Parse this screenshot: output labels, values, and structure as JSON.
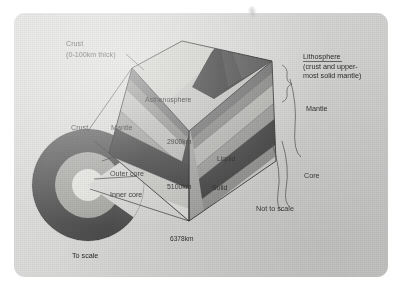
{
  "figure": {
    "type": "diagram",
    "media": "scanned photograph of a printed diagram",
    "background_color": "#d9d9d7"
  },
  "labels": {
    "crust_top": "Crust",
    "crust_top_detail": "(0-100km thick)",
    "asthenosphere": "Asthenosphere",
    "lithosphere": "Lithosphere",
    "lithosphere_detail_1": "(crust and upper-",
    "lithosphere_detail_2": "most solid mantle)",
    "mantle_right": "Mantle",
    "crust_left": "Crust",
    "mantle_left": "Mantle",
    "outer_core": "Outer core",
    "inner_core": "Inner core",
    "liquid": "Liquid",
    "solid": "Solid",
    "core_right": "Core",
    "depth_2900": "2900km",
    "depth_5100": "5100km",
    "radius_6378": "6378km",
    "not_to_scale": "Not to scale",
    "to_scale": "To scale"
  },
  "depths": {
    "crust_thickness_km": "0-100",
    "mantle_core_boundary_km": "2900",
    "outer_inner_core_boundary_km": "5100",
    "earth_radius_km": "6378"
  },
  "layers": [
    {
      "name": "Crust",
      "state": "Solid",
      "color": "#5e5e5e"
    },
    {
      "name": "Lithosphere",
      "state": "Solid",
      "color": "#6f6f6f"
    },
    {
      "name": "Asthenosphere",
      "state": "Plastic",
      "color": "#a9a9a7"
    },
    {
      "name": "Mantle",
      "state": "Solid",
      "color": "#3c3c3c"
    },
    {
      "name": "Outer core",
      "state": "Liquid",
      "color": "#8e8e8c"
    },
    {
      "name": "Inner core",
      "state": "Solid",
      "color": "#d2d2cf"
    }
  ],
  "globe": {
    "caption": "To scale",
    "rings": [
      {
        "name": "Mantle",
        "color": "#4a4a4a"
      },
      {
        "name": "Outer core",
        "color": "#a6a6a3"
      },
      {
        "name": "Inner core",
        "color": "#e6e6e3"
      }
    ]
  },
  "wedge": {
    "caption": "Not to scale"
  }
}
